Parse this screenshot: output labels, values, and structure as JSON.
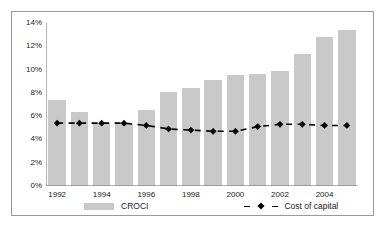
{
  "chart_data": {
    "type": "bar",
    "title": "",
    "subtitle": "",
    "xlabel": "",
    "ylabel": "",
    "categories": [
      "1992",
      "1993",
      "1994",
      "1995",
      "1996",
      "1997",
      "1998",
      "1999",
      "2000",
      "2001",
      "2002",
      "2003",
      "2004",
      "2005"
    ],
    "tick_labels_x": [
      "1992",
      "1994",
      "1996",
      "1998",
      "2000",
      "2002",
      "2004"
    ],
    "tick_labels_y": [
      "0%",
      "2%",
      "4%",
      "6%",
      "8%",
      "10%",
      "12%",
      "14%"
    ],
    "ylim": [
      0,
      14
    ],
    "ytick_step": 2,
    "grid": false,
    "legend_position": "bottom",
    "series": [
      {
        "name": "CROCI",
        "type": "bar",
        "color": "#c9c9c9",
        "values": [
          7.4,
          6.4,
          5.4,
          5.3,
          6.5,
          8.1,
          8.4,
          9.1,
          9.5,
          9.6,
          9.9,
          11.3,
          12.8,
          13.4
        ]
      },
      {
        "name": "Cost of capital",
        "type": "line",
        "color": "#000000",
        "linestyle": "dashed",
        "marker": "diamond",
        "values": [
          5.4,
          5.4,
          5.4,
          5.4,
          5.2,
          4.9,
          4.8,
          4.7,
          4.7,
          5.1,
          5.3,
          5.3,
          5.2,
          5.2
        ]
      }
    ]
  },
  "legend": {
    "croci_label": "CROCI",
    "cost_of_capital_label": "Cost of capital"
  }
}
